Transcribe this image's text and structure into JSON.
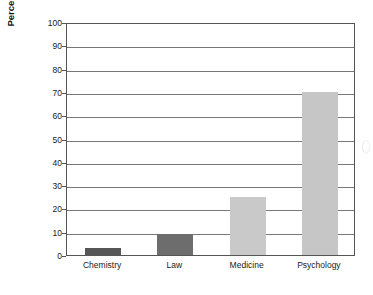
{
  "chart_data": {
    "type": "bar",
    "title": "",
    "subtitle": "",
    "xlabel": "",
    "ylabel": "Percentage gain in statistical reasoning",
    "categories": [
      "Chemistry",
      "Law",
      "Medicine",
      "Psychology"
    ],
    "values": [
      3,
      9,
      25,
      70
    ],
    "series": [
      {
        "name": "Percentage gain in statistical reasoning",
        "values": [
          3,
          9,
          25,
          70
        ]
      }
    ],
    "ylim": [
      0,
      100
    ],
    "yticks": [
      0,
      10,
      20,
      30,
      40,
      50,
      60,
      70,
      80,
      90,
      100
    ],
    "ytick_labels": [
      "0",
      "10",
      "20",
      "30",
      "40",
      "50",
      "60",
      "70",
      "80",
      "90",
      "100"
    ],
    "grid": true,
    "grid_axis": "y",
    "legend": false,
    "legend_position": "none",
    "bar_colors": [
      "#565656",
      "#6d6d6d",
      "#c9c9c9",
      "#c6c6c6"
    ],
    "frame_color": "#555555",
    "gridline_color": "#777777",
    "background_color": "#ffffff",
    "annotations": []
  },
  "axis": {
    "y_title": "Percentage gain in statistical reasoning"
  }
}
